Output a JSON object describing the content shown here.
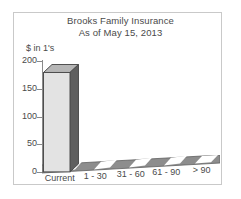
{
  "chart_data": {
    "type": "bar",
    "title": "Brooks Family Insurance",
    "subtitle": "As of May 15, 2013",
    "xlabel": "",
    "ylabel": "$ in 1's",
    "categories": [
      "Current",
      "1 - 30",
      "31 - 60",
      "61 - 90",
      "> 90"
    ],
    "values": [
      180,
      0,
      0,
      0,
      0
    ],
    "ylim": [
      0,
      200
    ],
    "yticks": [
      200,
      150,
      100,
      50,
      0
    ],
    "ytick_labels": [
      "200",
      "150",
      "100",
      "50",
      "0"
    ],
    "grid": false,
    "legend": false,
    "style": "3d-column",
    "series": [
      {
        "name": "Aging Balance",
        "values": [
          180,
          0,
          0,
          0,
          0
        ]
      }
    ]
  },
  "colors": {
    "bar_front": "#e3e3e3",
    "bar_top": "#b6b6b6",
    "bar_side": "#5f5f5f",
    "axis": "#8a8a8a",
    "text": "#4a4a4a",
    "border": "#c9c9c9",
    "floor_dark": "#8d8d8d",
    "floor_light": "#ffffff",
    "background": "#ffffff"
  }
}
